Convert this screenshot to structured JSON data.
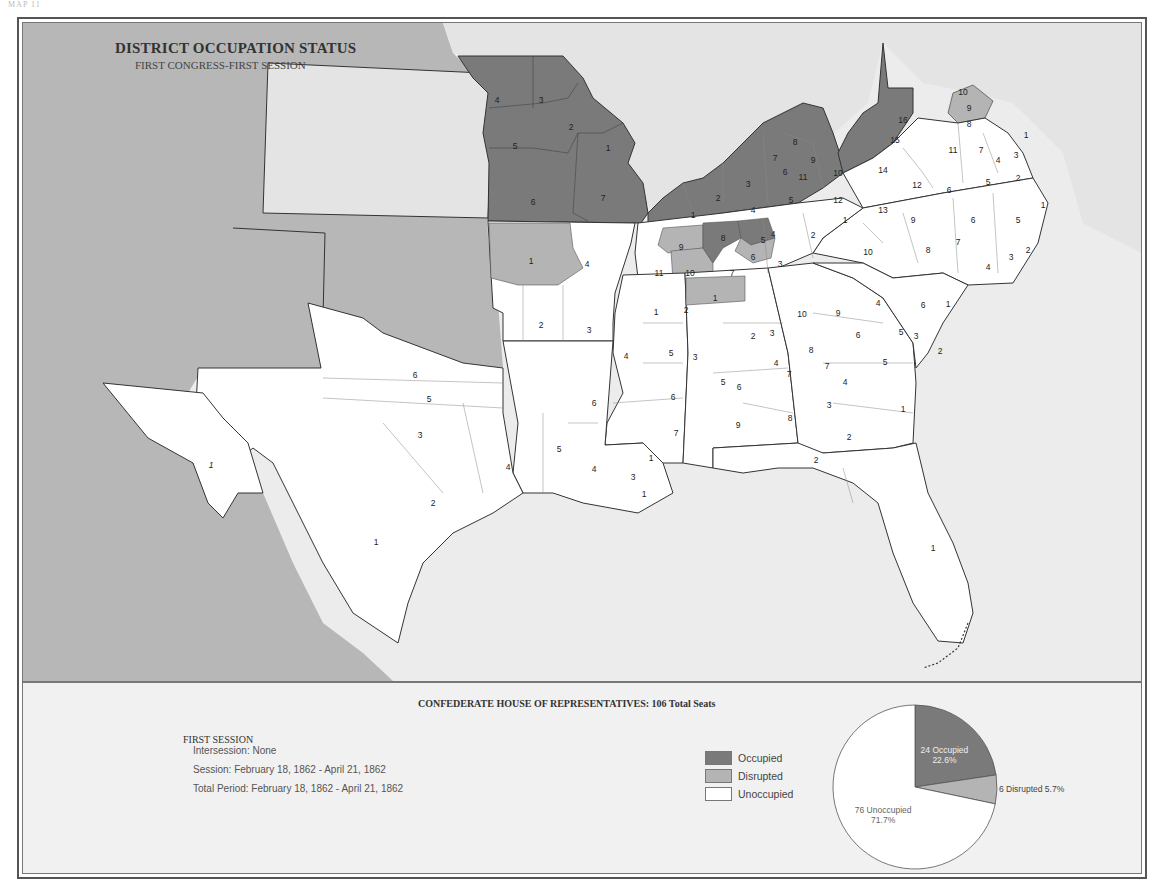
{
  "page_label": "MAP 11",
  "title": "DISTRICT OCCUPATION STATUS",
  "subtitle": "FIRST CONGRESS-FIRST SESSION",
  "colors": {
    "occupied": "#7a7a7a",
    "disrupted": "#b4b4b4",
    "unoccupied": "#ffffff",
    "union_territory": "#b7b7b7",
    "other_territory": "#e4e4e4",
    "sea": "#ececec"
  },
  "legend": {
    "heading": "CONFEDERATE HOUSE OF REPRESENTATIVES: 106 Total Seats",
    "session_heading": "FIRST SESSION",
    "intersession": "Intersession: None",
    "session": "Session: February 18, 1862 - April 21, 1862",
    "total_period": "Total Period: February 18, 1862 - April 21, 1862",
    "keys": [
      {
        "label": "Occupied",
        "status": "occupied"
      },
      {
        "label": "Disrupted",
        "status": "disrupted"
      },
      {
        "label": "Unoccupied",
        "status": "unoccupied"
      }
    ]
  },
  "chart_data": {
    "type": "pie",
    "title": "CONFEDERATE HOUSE OF REPRESENTATIVES: 106 Total Seats",
    "total": 106,
    "slices": [
      {
        "label": "Occupied",
        "value": 24,
        "percent": 22.6,
        "text": "24 Occupied",
        "pct_text": "22.6%"
      },
      {
        "label": "Disrupted",
        "value": 6,
        "percent": 5.7,
        "text": "6 Disrupted 5.7%",
        "pct_text": ""
      },
      {
        "label": "Unoccupied",
        "value": 76,
        "percent": 71.7,
        "text": "76 Unoccupied",
        "pct_text": "71.7%"
      }
    ]
  },
  "states": {
    "missouri": {
      "status": "occupied",
      "districts": [
        "1",
        "2",
        "3",
        "4",
        "5",
        "6",
        "7"
      ]
    },
    "kentucky": {
      "status": "occupied",
      "districts": [
        "1",
        "2",
        "3",
        "4",
        "5",
        "6",
        "7",
        "8",
        "9",
        "10",
        "11",
        "12"
      ]
    },
    "virginia": {
      "occupied": [
        "14",
        "15",
        "16"
      ],
      "disrupted": [
        "9"
      ],
      "unoccupied": [
        "1",
        "2",
        "3",
        "4",
        "5",
        "6",
        "7",
        "8",
        "10",
        "11",
        "12",
        "13"
      ]
    },
    "tennessee": {
      "occupied": [
        "8",
        "5"
      ],
      "disrupted": [
        "9",
        "10",
        "6"
      ],
      "unoccupied": [
        "1",
        "2",
        "3",
        "4",
        "7",
        "11"
      ]
    },
    "arkansas": {
      "disrupted": [
        "1"
      ],
      "unoccupied": [
        "2",
        "3",
        "4"
      ]
    },
    "mississippi": {
      "unoccupied": [
        "1",
        "2",
        "3",
        "4",
        "5",
        "6",
        "7"
      ]
    },
    "alabama": {
      "disrupted": [
        "1"
      ],
      "unoccupied": [
        "2",
        "3",
        "4",
        "5",
        "6",
        "7",
        "8",
        "9"
      ]
    },
    "georgia": {
      "unoccupied": [
        "1",
        "2",
        "3",
        "4",
        "5",
        "6",
        "7",
        "8",
        "9",
        "10"
      ]
    },
    "north_carolina": {
      "unoccupied": [
        "1",
        "2",
        "3",
        "4",
        "5",
        "6",
        "7",
        "8",
        "9",
        "10"
      ]
    },
    "south_carolina": {
      "unoccupied": [
        "1",
        "2",
        "3",
        "4",
        "5",
        "6"
      ]
    },
    "louisiana": {
      "unoccupied": [
        "1",
        "1",
        "3",
        "4",
        "5",
        "6"
      ]
    },
    "texas": {
      "unoccupied": [
        "1",
        "2",
        "3",
        "4",
        "5",
        "6"
      ]
    },
    "florida": {
      "unoccupied": [
        "1",
        "2"
      ]
    },
    "arizona_territory": {
      "unoccupied": [
        "1"
      ]
    }
  }
}
